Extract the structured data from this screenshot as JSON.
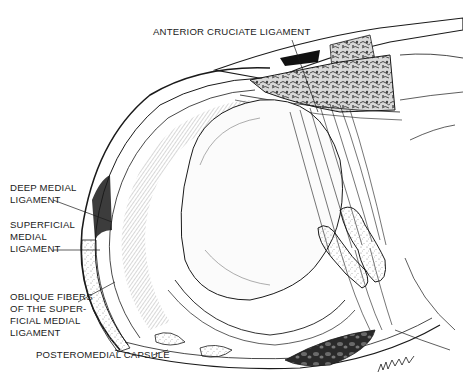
{
  "figure": {
    "colors": {
      "ink": "#1a1a1a",
      "background": "#ffffff",
      "stipple": "#9a9a9a"
    }
  },
  "labels": {
    "anterior_cruciate": {
      "lines": [
        "ANTERIOR CRUCIATE LIGAMENT"
      ]
    },
    "deep_medial": {
      "lines": [
        "DEEP MEDIAL",
        "LIGAMENT"
      ]
    },
    "superficial_medial": {
      "lines": [
        "SUPERFICIAL",
        "MEDIAL",
        "LIGAMENT"
      ]
    },
    "oblique_fibers": {
      "lines": [
        "OBLIQUE FIBERS",
        "OF THE SUPER-",
        "FICIAL MEDIAL",
        "LIGAMENT"
      ]
    },
    "posteromedial_capsule": {
      "lines": [
        "POSTEROMEDIAL CAPSULE"
      ]
    }
  }
}
